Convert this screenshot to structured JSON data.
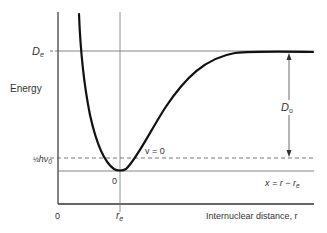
{
  "diagram": {
    "y_axis_label": "Energy",
    "x_axis_label": "Internuclear distance, r",
    "origin_label": "0",
    "x_tick_re": "r",
    "x_tick_re_sub": "e",
    "levels": {
      "De": {
        "main": "D",
        "sub": "e"
      },
      "zero_point": {
        "frac": "½",
        "main": "hν",
        "sub": "0"
      },
      "minimum_label": "0"
    },
    "annotations": {
      "vibrational_level": "v = 0",
      "displacement_main": "x = r − r",
      "displacement_sub": "e",
      "D0": {
        "main": "D",
        "sub": "o"
      }
    },
    "colors": {
      "curve": "#111111",
      "lines": "#555555",
      "text": "#333333"
    }
  }
}
